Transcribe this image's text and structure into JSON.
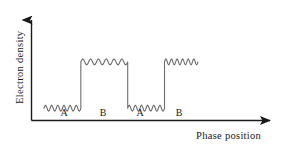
{
  "figure": {
    "background_color": "#ffffff",
    "line_color": "#6e6e6e",
    "axis_color": "#1a1a1a",
    "text_color": "#1a1a1a"
  },
  "chart_data": {
    "type": "line",
    "title": "",
    "xlabel": "Phase position",
    "ylabel": "Electron density",
    "grid": false,
    "legend": false,
    "axes": {
      "x_arrow": true,
      "y_arrow": true,
      "x_ticks": [],
      "y_ticks": [],
      "xlim": [
        0,
        1
      ],
      "ylim": [
        0,
        1
      ]
    },
    "series": [
      {
        "name": "Electron density",
        "style": "wavy-square-wave",
        "ripple_cycles_per_segment": 6,
        "segments": [
          {
            "label": "A",
            "level": "low",
            "x_start": 0.08,
            "x_end": 0.3,
            "y_level": 0.13
          },
          {
            "label": "B",
            "level": "high",
            "x_start": 0.3,
            "x_end": 0.58,
            "y_level": 0.62
          },
          {
            "label": "A",
            "level": "low",
            "x_start": 0.58,
            "x_end": 0.8,
            "y_level": 0.13
          },
          {
            "label": "B",
            "level": "high",
            "x_start": 0.8,
            "x_end": 1.0,
            "y_level": 0.62
          }
        ]
      }
    ],
    "region_labels": [
      {
        "text": "A",
        "x": 0.18
      },
      {
        "text": "B",
        "x": 0.44
      },
      {
        "text": "A",
        "x": 0.69
      },
      {
        "text": "B",
        "x": 0.9
      }
    ]
  }
}
